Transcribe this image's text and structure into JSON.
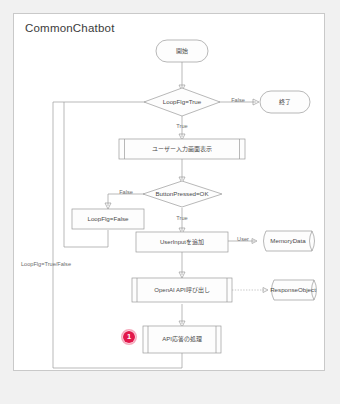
{
  "diagram": {
    "title": "CommonChatbot",
    "type": "flowchart",
    "accent_color": "#e2184b",
    "nodes": {
      "start": {
        "label": "開始",
        "shape": "terminator"
      },
      "end": {
        "label": "終了",
        "shape": "terminator"
      },
      "loop_decision": {
        "label": "LoopFlg=True",
        "shape": "decision"
      },
      "show_input_screen": {
        "label": "ユーザー入力画面表示",
        "shape": "predefined-process"
      },
      "button_decision": {
        "label": "ButtonPressed=OK",
        "shape": "decision"
      },
      "loopflg_false": {
        "label": "LoopFlg=False",
        "shape": "process"
      },
      "add_userinput": {
        "label": "UserInputを追加",
        "shape": "process"
      },
      "memory_data": {
        "label": "MemoryData",
        "shape": "data-store"
      },
      "openai_call": {
        "label": "OpenAI API呼び出し",
        "shape": "predefined-process"
      },
      "response_object": {
        "label": "ResponseObject",
        "shape": "data-store"
      },
      "api_response_handle": {
        "label": "API応答の処理",
        "shape": "predefined-process"
      }
    },
    "edge_labels": {
      "loop_false": "False",
      "loop_true": "True",
      "button_false": "False",
      "button_true": "True",
      "user_role": "User",
      "return_path": "LoopFlg=True/False"
    },
    "badges": [
      {
        "number": "1",
        "target": "api_response_handle"
      }
    ]
  }
}
